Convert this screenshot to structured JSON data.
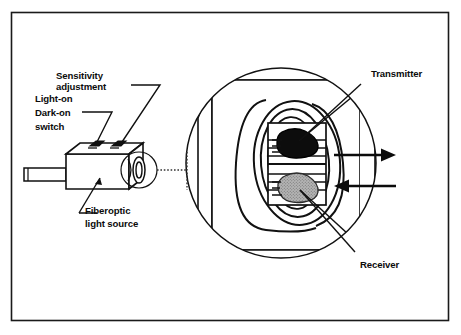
{
  "figure": {
    "frame": {
      "stroke_color": "#1a1a1a",
      "fill_color": "#ffffff"
    }
  },
  "labels": {
    "sensitivity_line1": "Sensitivity",
    "sensitivity_line2": "adjustment",
    "switch_line1": "Light-on",
    "switch_line2": "Dark-on",
    "switch_line3": "switch",
    "fiberoptic_line1": "Fiberoptic",
    "fiberoptic_line2": "light source",
    "transmitter": "Transmitter",
    "receiver": "Receiver"
  },
  "sensor_body": {
    "name": "fiberoptic sensor housing",
    "cable": "cable stub",
    "pots": [
      {
        "name": "light-on dark-on switch pot"
      },
      {
        "name": "sensitivity adjustment pot"
      }
    ],
    "lens_end": "fiberoptic lens end"
  },
  "magnifier": {
    "name": "magnified detail circle",
    "source_marker": "small circle at lens end",
    "connector": "dotted leader line"
  },
  "detail": {
    "transmitter_element": {
      "label": "Transmitter",
      "color": "#0d0d0d",
      "note": "emitting LED, dark fill"
    },
    "receiver_element": {
      "label": "Receiver",
      "color": "#a8a8a8",
      "note": "photodetector, stippled gray fill"
    },
    "arrows": [
      {
        "name": "transmitted-beam-arrow",
        "direction": "right"
      },
      {
        "name": "received-beam-arrow",
        "direction": "left"
      }
    ]
  },
  "colors": {
    "ink": "#0b0b0b",
    "paper": "#ffffff",
    "transmitter_fill": "#0d0d0d",
    "receiver_fill": "#a8a8a8",
    "frame": "#1a1a1a"
  }
}
